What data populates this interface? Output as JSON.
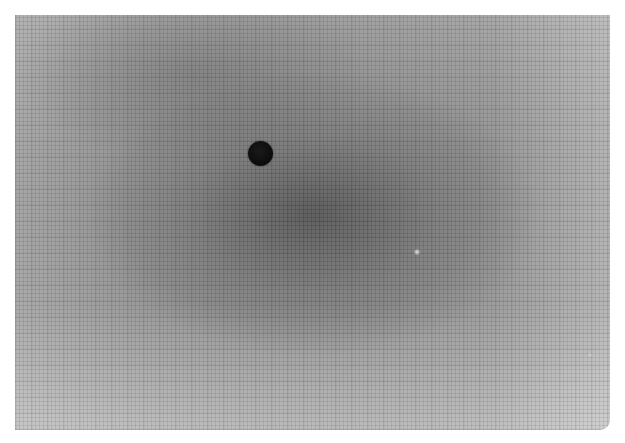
{
  "image": {
    "description": "Grayscale photograph of a fine mesh/fabric surface with a dark circular spot and a small bright speck",
    "background_color": "#ffffff",
    "photo_region": {
      "left": 15,
      "top": 15,
      "width": 595,
      "height": 415
    },
    "base_tone": "#8f8f8f",
    "features": [
      {
        "name": "dark-dot",
        "center_x": 260,
        "center_y": 153,
        "diameter": 25,
        "color": "#0e0e0e"
      },
      {
        "name": "bright-speck",
        "center_x": 417,
        "center_y": 252,
        "diameter": 5,
        "color": "#e6e6e6"
      },
      {
        "name": "faint-speck",
        "center_x": 590,
        "center_y": 355,
        "diameter": 4,
        "color": "#d0d0d0"
      }
    ]
  }
}
